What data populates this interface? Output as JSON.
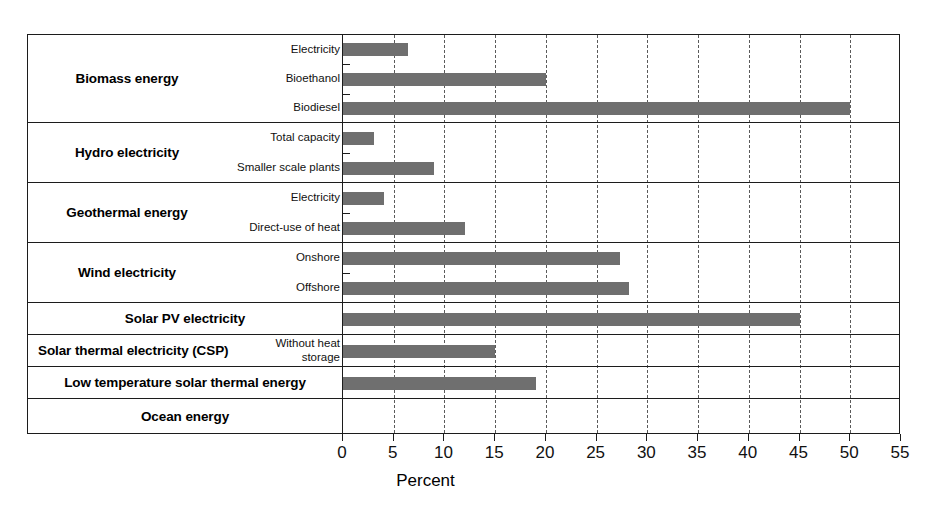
{
  "chart_data": {
    "type": "bar",
    "orientation": "horizontal",
    "title": "",
    "xlabel": "Percent",
    "ylabel": "",
    "xlim": [
      0,
      55
    ],
    "xticks": [
      0,
      5,
      10,
      15,
      20,
      25,
      30,
      35,
      40,
      45,
      50,
      55
    ],
    "xtick_labels": [
      "0",
      "5",
      "10",
      "15",
      "20",
      "25",
      "30",
      "35",
      "40",
      "45",
      "50",
      "55"
    ],
    "grid": "vertical-dashed",
    "legend": "none",
    "bar_color": "#6f6f6f",
    "groups": [
      {
        "label": "Biomass energy",
        "rows": [
          {
            "label": "Electricity",
            "value": 6.4
          },
          {
            "label": "Bioethanol",
            "value": 20.0
          },
          {
            "label": "Biodiesel",
            "value": 50.0
          }
        ]
      },
      {
        "label": "Hydro electricity",
        "rows": [
          {
            "label": "Total capacity",
            "value": 3.1
          },
          {
            "label": "Smaller scale plants",
            "value": 9.0
          }
        ]
      },
      {
        "label": "Geothermal energy",
        "rows": [
          {
            "label": "Electricity",
            "value": 4.0
          },
          {
            "label": "Direct-use of heat",
            "value": 12.0
          }
        ]
      },
      {
        "label": "Wind electricity",
        "rows": [
          {
            "label": "Onshore",
            "value": 27.3
          },
          {
            "label": "Offshore",
            "value": 28.2
          }
        ]
      },
      {
        "label": "Solar PV electricity",
        "rows": [
          {
            "label": "",
            "value": 45.0
          }
        ]
      },
      {
        "label": "Solar thermal electricity (CSP)",
        "rows": [
          {
            "label": "Without heat storage",
            "value": 15.0
          }
        ]
      },
      {
        "label": "Low temperature solar thermal energy",
        "rows": [
          {
            "label": "",
            "value": 19.0
          }
        ]
      },
      {
        "label": "Ocean energy",
        "rows": [
          {
            "label": "",
            "value": 0
          }
        ]
      }
    ],
    "categories": [
      "Biomass energy - Electricity",
      "Biomass energy - Bioethanol",
      "Biomass energy - Biodiesel",
      "Hydro electricity - Total capacity",
      "Hydro electricity - Smaller scale plants",
      "Geothermal energy - Electricity",
      "Geothermal energy - Direct-use of heat",
      "Wind electricity - Onshore",
      "Wind electricity - Offshore",
      "Solar PV electricity",
      "Solar thermal electricity (CSP) - Without heat storage",
      "Low temperature solar thermal energy",
      "Ocean energy"
    ],
    "values": [
      6.4,
      20.0,
      50.0,
      3.1,
      9.0,
      4.0,
      12.0,
      27.3,
      28.2,
      45.0,
      15.0,
      19.0,
      0
    ]
  }
}
